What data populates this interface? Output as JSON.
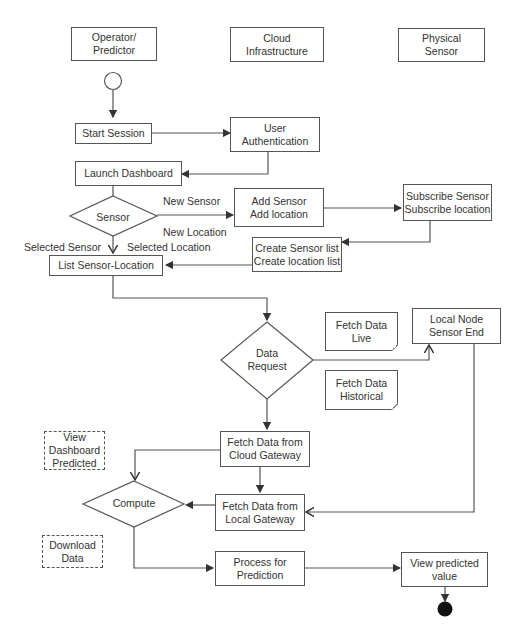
{
  "diagram": {
    "type": "activity-flowchart",
    "lanes": [
      {
        "id": "operator",
        "label": "Operator/\nPredictor"
      },
      {
        "id": "cloud",
        "label": "Cloud\nInfrastructure"
      },
      {
        "id": "sensor",
        "label": "Physical\nSensor"
      }
    ],
    "nodes": {
      "start_session": "Start Session",
      "user_auth": "User\nAuthentication",
      "launch_dashboard": "Launch Dashboard",
      "sensor_decision": "Sensor",
      "add_sensor": "Add Sensor\nAdd location",
      "subscribe_sensor": "Subscribe Sensor\nSubscribe location",
      "create_list": "Create Sensor list\nCreate location list",
      "list_sensor_location": "List Sensor-Location",
      "data_request": "Data\nRequest",
      "fetch_live": "Fetch Data\nLive",
      "fetch_historical": "Fetch Data\nHistorical",
      "local_node": "Local Node\nSensor End",
      "fetch_cloud": "Fetch Data from\nCloud Gateway",
      "fetch_local": "Fetch Data from\nLocal Gateway",
      "compute": "Compute",
      "view_dashboard": "View\nDashboard\nPredicted",
      "download_data": "Download\nData",
      "process_prediction": "Process for\nPrediction",
      "view_predicted": "View predicted\nvalue"
    },
    "edge_labels": {
      "new_sensor": "New Sensor",
      "new_location": "New  Location",
      "selected_sensor": "Selected Sensor",
      "selected_location": "Selected  Location"
    },
    "edges": [
      [
        "initial",
        "start_session"
      ],
      [
        "start_session",
        "user_auth"
      ],
      [
        "user_auth",
        "launch_dashboard"
      ],
      [
        "launch_dashboard",
        "sensor_decision"
      ],
      [
        "sensor_decision",
        "add_sensor"
      ],
      [
        "add_sensor",
        "subscribe_sensor"
      ],
      [
        "subscribe_sensor",
        "create_list"
      ],
      [
        "create_list",
        "list_sensor_location"
      ],
      [
        "sensor_decision",
        "list_sensor_location"
      ],
      [
        "list_sensor_location",
        "data_request"
      ],
      [
        "data_request",
        "local_node"
      ],
      [
        "data_request",
        "fetch_cloud"
      ],
      [
        "fetch_cloud",
        "compute"
      ],
      [
        "fetch_cloud",
        "fetch_local"
      ],
      [
        "local_node",
        "fetch_local"
      ],
      [
        "fetch_local",
        "compute"
      ],
      [
        "compute",
        "process_prediction"
      ],
      [
        "process_prediction",
        "view_predicted"
      ],
      [
        "view_predicted",
        "final"
      ]
    ],
    "colors": {
      "stroke": "#555555",
      "text": "#333333",
      "final_node": "#111111"
    }
  }
}
